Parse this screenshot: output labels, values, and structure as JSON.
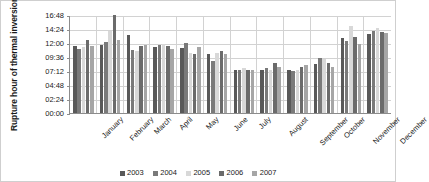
{
  "chart_data": {
    "type": "bar",
    "title": "",
    "xlabel": "",
    "ylabel": "Rupture hour of thermal inversion",
    "categories": [
      "January",
      "February",
      "March",
      "April",
      "May",
      "June",
      "July",
      "August",
      "September",
      "October",
      "November",
      "December"
    ],
    "ytick_labels": [
      "16:48",
      "14:24",
      "12:00",
      "09:36",
      "07:12",
      "04:48",
      "02:24",
      "00:00"
    ],
    "ytick_values": [
      16.8,
      14.4,
      12.0,
      9.6,
      7.2,
      4.8,
      2.4,
      0.0
    ],
    "ylim": [
      0,
      16.8
    ],
    "grid": true,
    "legend_position": "bottom",
    "value_format": "hh:mm",
    "series": [
      {
        "name": "2003",
        "color": "#595959",
        "values": [
          11.5,
          11.6,
          13.4,
          11.4,
          11.2,
          10.05,
          7.3,
          7.3,
          7.3,
          8.4,
          12.8,
          13.55
        ],
        "value_labels": [
          "11:30",
          "11:36",
          "13:24",
          "11:24",
          "11:12",
          "10:03",
          "07:18",
          "07:18",
          "07:18",
          "08:24",
          "12:48",
          "13:33"
        ]
      },
      {
        "name": "2004",
        "color": "#7a7a7a",
        "values": [
          11.05,
          12.25,
          10.75,
          11.7,
          11.95,
          8.95,
          7.3,
          7.7,
          7.25,
          9.35,
          12.4,
          14.1
        ],
        "value_labels": [
          "11:03",
          "12:15",
          "10:45",
          "11:42",
          "11:57",
          "08:57",
          "07:18",
          "07:42",
          "07:15",
          "09:21",
          "12:24",
          "14:06"
        ]
      },
      {
        "name": "2005",
        "color": "#d8d8d8",
        "values": [
          11.35,
          14.05,
          10.6,
          11.85,
          10.3,
          10.25,
          7.7,
          7.3,
          7.3,
          9.2,
          15.0,
          14.6
        ],
        "value_labels": [
          "11:21",
          "14:03",
          "10:36",
          "11:51",
          "10:18",
          "10:15",
          "07:42",
          "07:18",
          "07:18",
          "09:12",
          "15:00",
          "14:36"
        ]
      },
      {
        "name": "2006",
        "color": "#6b6b6b",
        "values": [
          12.5,
          16.8,
          11.55,
          11.5,
          10.1,
          10.7,
          7.3,
          8.55,
          7.9,
          8.65,
          13.1,
          13.9
        ],
        "value_labels": [
          "12:30",
          "16:48",
          "11:33",
          "11:30",
          "10:06",
          "10:42",
          "07:18",
          "08:33",
          "07:54",
          "08:39",
          "13:06",
          "13:54"
        ]
      },
      {
        "name": "2007",
        "color": "#a6a6a6",
        "values": [
          11.45,
          12.6,
          11.65,
          10.95,
          11.3,
          10.2,
          7.3,
          7.9,
          8.15,
          7.95,
          11.9,
          13.75
        ],
        "value_labels": [
          "11:27",
          "12:36",
          "11:39",
          "10:57",
          "11:18",
          "10:12",
          "07:18",
          "07:54",
          "08:09",
          "07:57",
          "11:54",
          "13:45"
        ]
      }
    ]
  }
}
